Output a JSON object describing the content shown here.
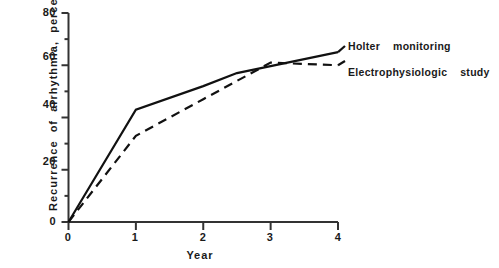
{
  "chart_data": {
    "type": "line",
    "title": "",
    "xlabel": "Year",
    "ylabel": "Recurrence of  arrhythmia,  percent",
    "xlim": [
      0,
      4
    ],
    "ylim": [
      0,
      80
    ],
    "x_ticks": [
      "0",
      "1",
      "2",
      "3",
      "4"
    ],
    "x_tick_values": [
      0,
      1,
      2,
      3,
      4
    ],
    "y_ticks": [
      "0",
      "20",
      "40",
      "60",
      "80"
    ],
    "y_tick_values": [
      0,
      20,
      40,
      60,
      80
    ],
    "y_minor_tick_values": [
      10,
      30,
      50,
      70
    ],
    "grid": false,
    "legend_position": "right-of-plot-at-line-ends",
    "series": [
      {
        "name": "Holter  monitoring",
        "style": "solid",
        "color": "#111111",
        "x": [
          0,
          1,
          2,
          2.5,
          4
        ],
        "values": [
          0,
          43,
          52,
          57,
          65
        ]
      },
      {
        "name": "Electrophysiologic   study",
        "style": "dashed",
        "color": "#111111",
        "x": [
          0,
          1,
          2,
          3,
          4
        ],
        "values": [
          0,
          33,
          47,
          61,
          60
        ]
      }
    ]
  },
  "axis": {
    "axis_color": "#333333",
    "y_title": "Recurrence  of  arrhythmia,  percent",
    "x_title": "Year"
  },
  "legend": {
    "holter_label": "Holter    monitoring",
    "eps_label": "Electrophysiologic    study"
  }
}
